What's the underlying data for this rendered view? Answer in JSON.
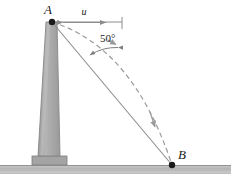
{
  "figure": {
    "background_color": "#ffffff",
    "width": 231,
    "height": 186
  },
  "labels": {
    "point_a": "A",
    "point_b": "B",
    "speed": "u",
    "angle": "50°"
  },
  "colors": {
    "tower_fill": "#a6a6a6",
    "tower_edge": "#8a8a8a",
    "tower_highlight": "#bdbdbd",
    "base_fill": "#a0a0a0",
    "base_edge": "#7d7d7d",
    "ground_fill": "#bcbcbc",
    "ground_edge": "#9a9a9a",
    "line_of_sight": "#8c8c8c",
    "trajectory": "#9a9a9a",
    "arc": "#7f7f7f",
    "marker": "#1a1a1a",
    "text": "#1a1a1a"
  },
  "geometry": {
    "point_a": {
      "x": 52,
      "y": 22
    },
    "point_b": {
      "x": 172,
      "y": 165
    },
    "ground_y": 165,
    "tower_top_left": 46,
    "tower_top_right": 57,
    "tower_bottom_left": 38,
    "tower_bottom_right": 60,
    "pedestal_left": 32,
    "pedestal_right": 67,
    "horizontal_ref_end_x": 122,
    "angle_degrees": 50
  }
}
